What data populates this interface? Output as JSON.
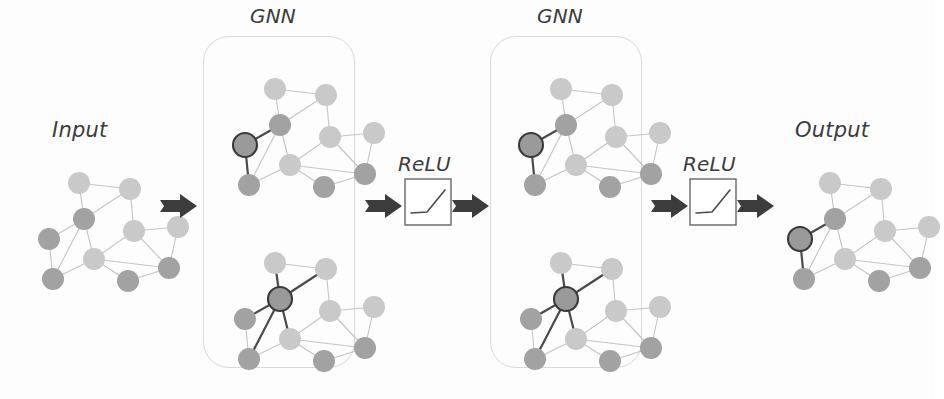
{
  "figure": {
    "background_color": "#fdfdfd",
    "orientation": "left-to-right"
  },
  "labels": {
    "input": "Input",
    "output": "Output",
    "gnn_1": "GNN",
    "gnn_2": "GNN",
    "relu_1": "ReLU",
    "relu_2": "ReLU"
  },
  "colors": {
    "node_light": "#c9c9c9",
    "node_dark": "#a2a2a2",
    "node_highlight_fill": "#9a9a9a",
    "node_highlight_stroke": "#3a3a3a",
    "edge": "#c4c4c4",
    "edge_highlight": "#4a4a4a",
    "box_border": "#d9d9d9",
    "relu_border": "#5a5a5a",
    "arrow": "#3c3c3c",
    "text": "#3b3b3b"
  },
  "geometry": {
    "node_radius": 11,
    "highlight_node_radius": 12,
    "gnn_box_radius": 26,
    "graph_width": 150,
    "graph_height": 125
  },
  "graph": {
    "nodes": [
      {
        "id": "n0",
        "x": 42,
        "y": 16,
        "shade": "light"
      },
      {
        "id": "n1",
        "x": 93,
        "y": 22,
        "shade": "light"
      },
      {
        "id": "n2",
        "x": 47,
        "y": 52,
        "shade": "dark"
      },
      {
        "id": "n3",
        "x": 12,
        "y": 72,
        "shade": "dark"
      },
      {
        "id": "n4",
        "x": 16,
        "y": 112,
        "shade": "dark"
      },
      {
        "id": "n5",
        "x": 57,
        "y": 92,
        "shade": "light"
      },
      {
        "id": "n6",
        "x": 97,
        "y": 64,
        "shade": "light"
      },
      {
        "id": "n7",
        "x": 141,
        "y": 60,
        "shade": "light"
      },
      {
        "id": "n8",
        "x": 132,
        "y": 101,
        "shade": "dark"
      },
      {
        "id": "n9",
        "x": 91,
        "y": 114,
        "shade": "dark"
      }
    ],
    "edges": [
      [
        "n0",
        "n1"
      ],
      [
        "n0",
        "n2"
      ],
      [
        "n1",
        "n2"
      ],
      [
        "n1",
        "n6"
      ],
      [
        "n2",
        "n3"
      ],
      [
        "n2",
        "n4"
      ],
      [
        "n2",
        "n5"
      ],
      [
        "n3",
        "n4"
      ],
      [
        "n4",
        "n5"
      ],
      [
        "n5",
        "n6"
      ],
      [
        "n5",
        "n8"
      ],
      [
        "n5",
        "n9"
      ],
      [
        "n6",
        "n7"
      ],
      [
        "n6",
        "n8"
      ],
      [
        "n7",
        "n8"
      ],
      [
        "n8",
        "n9"
      ]
    ]
  },
  "highlight_variants": {
    "left_node": {
      "node": "n3",
      "highlight_edges": [
        [
          "n3",
          "n2"
        ],
        [
          "n3",
          "n4"
        ]
      ],
      "description": "highlighted node on the far left of the graph"
    },
    "center_node": {
      "node": "n2",
      "highlight_edges": [
        [
          "n2",
          "n0"
        ],
        [
          "n2",
          "n1"
        ],
        [
          "n2",
          "n3"
        ],
        [
          "n2",
          "n4"
        ],
        [
          "n2",
          "n5"
        ]
      ],
      "description": "highlighted node at the center-left with bold edges to its neighbours"
    }
  },
  "panels": [
    {
      "name": "input-graph",
      "type": "graph",
      "x": 22,
      "y": 152,
      "highlight": "none"
    },
    {
      "name": "arrow-1",
      "type": "arrow",
      "x": 160,
      "y": 193
    },
    {
      "name": "gnn-box-1",
      "type": "gnn-box",
      "x": 203,
      "y": 36,
      "width": 152,
      "height": 332
    },
    {
      "name": "gnn1-graph-top",
      "type": "graph",
      "x": 218,
      "y": 58,
      "highlight": "left_node"
    },
    {
      "name": "gnn1-graph-bottom",
      "type": "graph",
      "x": 218,
      "y": 232,
      "highlight": "center_node"
    },
    {
      "name": "arrow-2",
      "type": "arrow",
      "x": 365,
      "y": 193
    },
    {
      "name": "relu-box-1",
      "type": "relu",
      "x": 404,
      "y": 178
    },
    {
      "name": "arrow-3",
      "type": "arrow",
      "x": 452,
      "y": 193
    },
    {
      "name": "gnn-box-2",
      "type": "gnn-box",
      "x": 490,
      "y": 36,
      "width": 152,
      "height": 332
    },
    {
      "name": "gnn2-graph-top",
      "type": "graph",
      "x": 504,
      "y": 58,
      "highlight": "left_node"
    },
    {
      "name": "gnn2-graph-bottom",
      "type": "graph",
      "x": 504,
      "y": 232,
      "highlight": "center_node"
    },
    {
      "name": "arrow-4",
      "type": "arrow",
      "x": 651,
      "y": 193
    },
    {
      "name": "relu-box-2",
      "type": "relu",
      "x": 689,
      "y": 178
    },
    {
      "name": "arrow-5",
      "type": "arrow",
      "x": 737,
      "y": 193
    },
    {
      "name": "output-graph",
      "type": "graph",
      "x": 773,
      "y": 152,
      "highlight": "left_node"
    }
  ],
  "relu_plot": {
    "description": "ReLU activation curve: flat segment then linear rise",
    "box_size": 46,
    "points": [
      [
        6,
        34
      ],
      [
        22,
        33
      ],
      [
        40,
        11
      ]
    ]
  },
  "label_positions": {
    "input": {
      "x": 52,
      "y": 118
    },
    "gnn_1": {
      "x": 250,
      "y": 4
    },
    "relu_1": {
      "x": 398,
      "y": 152
    },
    "gnn_2": {
      "x": 537,
      "y": 4
    },
    "relu_2": {
      "x": 683,
      "y": 152
    },
    "output": {
      "x": 795,
      "y": 118
    }
  }
}
